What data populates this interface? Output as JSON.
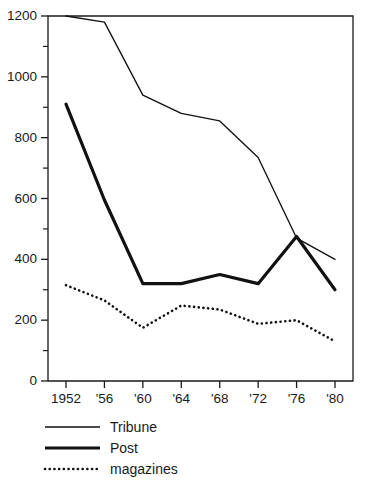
{
  "chart_data": {
    "type": "line",
    "title": "",
    "subtitle": "",
    "xlabel": "",
    "ylabel": "",
    "xlim": [
      1952,
      1980
    ],
    "ylim": [
      0,
      1200
    ],
    "grid": false,
    "legend_position": "bottom-left",
    "x": [
      1952,
      1956,
      1960,
      1964,
      1968,
      1972,
      1976,
      1980
    ],
    "categories": [
      "1952",
      "'56",
      "'60",
      "'64",
      "'68",
      "'72",
      "'76",
      "'80"
    ],
    "y_ticks": [
      0,
      200,
      400,
      600,
      800,
      1000,
      1200
    ],
    "y_tick_labels": [
      "0",
      "200",
      "400",
      "600",
      "800",
      "1000",
      "1200"
    ],
    "y_minor_ticks": [
      100,
      300,
      500,
      700,
      900,
      1100
    ],
    "series": [
      {
        "name": "Tribune",
        "style": "thin-solid",
        "values": [
          1200,
          1180,
          940,
          880,
          855,
          735,
          470,
          400
        ]
      },
      {
        "name": "Post",
        "style": "thick-solid",
        "values": [
          910,
          595,
          320,
          320,
          350,
          320,
          475,
          300
        ]
      },
      {
        "name": "magazines",
        "style": "dotted",
        "values": [
          315,
          265,
          175,
          248,
          235,
          188,
          200,
          130
        ]
      }
    ]
  },
  "legend": {
    "items": [
      {
        "label": "Tribune",
        "style": "thin-solid"
      },
      {
        "label": "Post",
        "style": "thick-solid"
      },
      {
        "label": "magazines",
        "style": "dotted"
      }
    ]
  },
  "colors": {
    "ink": "#111111",
    "background": "#ffffff"
  }
}
